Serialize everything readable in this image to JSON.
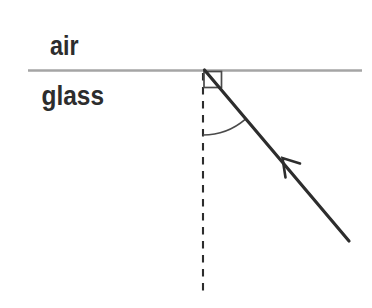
{
  "diagram": {
    "media": {
      "top": "air",
      "bottom": "glass"
    },
    "colors": {
      "ink": "#2d2d2d",
      "boundary": "#a5a5a5",
      "detail": "#4a4a4a",
      "background": "#ffffff"
    }
  }
}
